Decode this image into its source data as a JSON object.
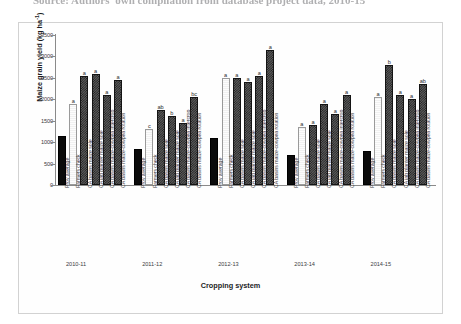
{
  "source_caption": "Source: Authors' own compilation from database project data, 2010-15",
  "chart_data": {
    "type": "bar",
    "title": "",
    "xlabel": "Cropping system",
    "ylabel": "Maize grain yield (kg ha-1)",
    "ylabel_base": "Maize grain yield (kg ha",
    "ylabel_sup": "-1",
    "ylabel_tail": ")",
    "ylim": [
      0,
      3500
    ],
    "yticks": [
      0,
      500,
      1000,
      1500,
      2000,
      2500,
      3000,
      3500
    ],
    "grid": false,
    "legend": "none",
    "categories": [
      "Prov average",
      "Farmers check",
      "CA basins maize sole",
      "CA jab planter maize sole",
      "CA basins maize-cowpea intercrop",
      "CA basins maize-cowpea rotation"
    ],
    "groups": [
      {
        "year": "2010-11",
        "values": [
          1150,
          1900,
          2550,
          2600,
          2100,
          2450
        ],
        "letters": [
          "",
          "a",
          "a",
          "a",
          "a",
          "a"
        ],
        "fills": [
          "solid",
          "light",
          "checker",
          "checker",
          "checker",
          "checker"
        ]
      },
      {
        "year": "2011-12",
        "values": [
          850,
          1300,
          1750,
          1600,
          1450,
          2050
        ],
        "letters": [
          "",
          "c",
          "ab",
          "b",
          "a",
          "bc"
        ],
        "fills": [
          "solid",
          "light",
          "checker",
          "checker",
          "checker",
          "checker"
        ]
      },
      {
        "year": "2012-13",
        "values": [
          1100,
          2500,
          2500,
          2400,
          2550,
          3150
        ],
        "letters": [
          "",
          "a",
          "a",
          "a",
          "a",
          "a"
        ],
        "fills": [
          "solid",
          "light",
          "checker",
          "checker",
          "checker",
          "checker"
        ]
      },
      {
        "year": "2013-14",
        "values": [
          700,
          1350,
          1400,
          1900,
          1650,
          2100
        ],
        "letters": [
          "",
          "a",
          "a",
          "a",
          "a",
          "a"
        ],
        "fills": [
          "solid",
          "light",
          "checker",
          "checker",
          "checker",
          "checker"
        ]
      },
      {
        "year": "2014-15",
        "values": [
          800,
          2050,
          2800,
          2100,
          2000,
          2350
        ],
        "letters": [
          "",
          "a",
          "b",
          "a",
          "a",
          "ab"
        ],
        "fills": [
          "solid",
          "light",
          "checker",
          "checker",
          "checker",
          "checker"
        ]
      }
    ]
  }
}
